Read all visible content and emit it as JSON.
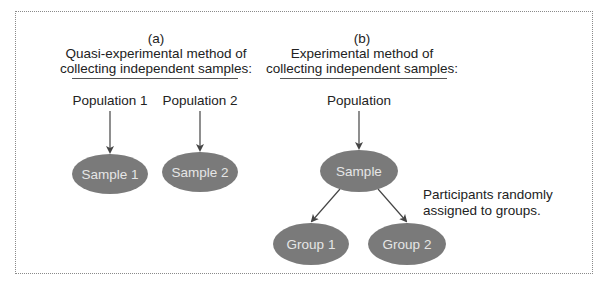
{
  "panel_a": {
    "label": "(a)",
    "title_line1": "Quasi-experimental method of",
    "title_line2": "collecting independent samples:",
    "population_1": "Population 1",
    "population_2": "Population 2",
    "sample_1": "Sample 1",
    "sample_2": "Sample 2"
  },
  "panel_b": {
    "label": "(b)",
    "title_line1": "Experimental method of",
    "title_line2": "collecting independent samples:",
    "population": "Population",
    "sample": "Sample",
    "group_1": "Group 1",
    "group_2": "Group 2",
    "note_line1": "Participants randomly",
    "note_line2": "assigned to groups."
  },
  "colors": {
    "ellipse_fill": "#7a7a7a",
    "ellipse_text": "#e6e6e6",
    "arrow": "#444444",
    "border": "#8a8a8a"
  }
}
